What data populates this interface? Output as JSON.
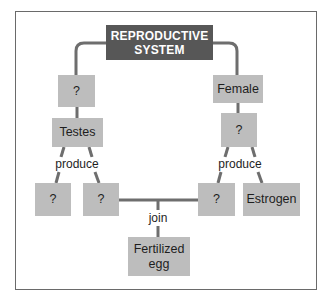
{
  "title": "REPRODUCTIVE SYSTEM",
  "title_lines": [
    "REPRODUCTIVE",
    "SYSTEM"
  ],
  "nodes": {
    "male_unknown": "?",
    "female": "Female",
    "testes": "Testes",
    "ovaries_unknown": "?",
    "testes_product_1": "?",
    "testes_product_2": "?",
    "ovary_product_1": "?",
    "estrogen": "Estrogen",
    "fertilized_egg": "Fertilized egg",
    "fertilized_egg_lines": [
      "Fertilized",
      "egg"
    ]
  },
  "labels": {
    "produce_left": "produce",
    "produce_right": "produce",
    "join": "join"
  },
  "colors": {
    "title_fill": "#575757",
    "node_fill": "#bdbdbd",
    "connector": "#6e6e6e",
    "frame": "#6a6a6a"
  }
}
